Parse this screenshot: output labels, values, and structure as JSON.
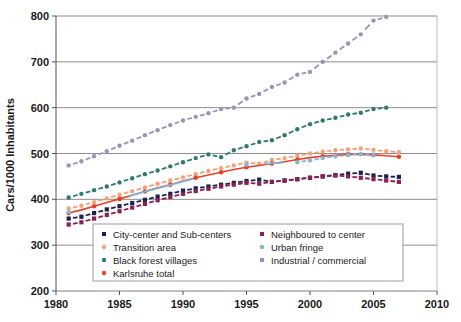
{
  "chart_data": {
    "type": "scatter",
    "title": "",
    "xlabel": "",
    "ylabel": "Cars/1000 Inhabitants",
    "xlim": [
      1980,
      2010
    ],
    "ylim": [
      200,
      800
    ],
    "xticks": [
      1980,
      1985,
      1990,
      1995,
      2000,
      2005,
      2010
    ],
    "yticks": [
      200,
      300,
      400,
      500,
      600,
      700,
      800
    ],
    "grid": "horizontal",
    "legend_position": "inside-bottom-center",
    "series": [
      {
        "name": "City-center and Sub-centers",
        "color": "#1f2050",
        "marker": "square-dashed",
        "x": [
          1981,
          1982,
          1983,
          1984,
          1985,
          1986,
          1987,
          1988,
          1989,
          1990,
          1991,
          1992,
          1993,
          1994,
          1995,
          1996,
          1997,
          1998,
          1999,
          2000,
          2001,
          2002,
          2003,
          2004,
          2005,
          2006,
          2007
        ],
        "y": [
          358,
          362,
          370,
          378,
          385,
          392,
          399,
          406,
          412,
          419,
          424,
          428,
          432,
          436,
          440,
          443,
          438,
          441,
          444,
          447,
          450,
          453,
          456,
          458,
          452,
          450,
          449
        ]
      },
      {
        "name": "Transition area",
        "color": "#f5a177",
        "marker": "circle-dashed",
        "x": [
          1981,
          1982,
          1983,
          1984,
          1985,
          1986,
          1987,
          1988,
          1989,
          1990,
          1991,
          1992,
          1993,
          1994,
          1995,
          1996,
          1997,
          1998,
          1999,
          2000,
          2001,
          2002,
          2003,
          2004,
          2005,
          2006,
          2007
        ],
        "y": [
          380,
          386,
          394,
          402,
          410,
          418,
          426,
          434,
          441,
          448,
          455,
          462,
          468,
          474,
          480,
          478,
          486,
          490,
          495,
          500,
          504,
          507,
          509,
          511,
          508,
          505,
          503
        ]
      },
      {
        "name": "Black forest villages",
        "color": "#2e7a72",
        "marker": "circle-dashed",
        "x": [
          1981,
          1982,
          1983,
          1984,
          1985,
          1986,
          1987,
          1988,
          1989,
          1990,
          1991,
          1992,
          1993,
          1994,
          1995,
          1996,
          1997,
          1998,
          1999,
          2000,
          2001,
          2002,
          2003,
          2004,
          2005,
          2006
        ],
        "y": [
          404,
          412,
          420,
          428,
          437,
          446,
          455,
          463,
          472,
          481,
          490,
          498,
          492,
          507,
          516,
          525,
          529,
          540,
          553,
          564,
          572,
          578,
          585,
          589,
          597,
          600
        ]
      },
      {
        "name": "Karlsruhe total",
        "color": "#e8402a",
        "marker": "circle-line",
        "x": [
          1981,
          1982,
          1983,
          1984,
          1985,
          1986,
          1987,
          1988,
          1989,
          1990,
          1991,
          1992,
          1993,
          1994,
          1995,
          1996,
          1997,
          1998,
          1999,
          2000,
          2001,
          2002,
          2003,
          2004,
          2005,
          2006,
          2007
        ],
        "y": [
          370,
          377,
          385,
          393,
          401,
          409,
          417,
          425,
          432,
          440,
          447,
          453,
          459,
          465,
          470,
          474,
          478,
          482,
          487,
          491,
          494,
          496,
          498,
          498,
          497,
          495,
          493
        ]
      },
      {
        "name": "Neighboured to center",
        "color": "#8c2050",
        "marker": "square-dashed",
        "x": [
          1981,
          1982,
          1983,
          1984,
          1985,
          1986,
          1987,
          1988,
          1989,
          1990,
          1991,
          1992,
          1993,
          1994,
          1995,
          1996,
          1997,
          1998,
          1999,
          2000,
          2001,
          2002,
          2003,
          2004,
          2005,
          2006,
          2007
        ],
        "y": [
          345,
          350,
          358,
          366,
          374,
          382,
          390,
          398,
          405,
          412,
          418,
          423,
          428,
          432,
          436,
          434,
          438,
          441,
          444,
          447,
          450,
          452,
          450,
          447,
          444,
          441,
          438
        ]
      },
      {
        "name": "Urban fringe",
        "color": "#7fb8d8",
        "marker": "circle-dashed",
        "x": [
          1981,
          1995,
          1999,
          2000,
          2001,
          2002,
          2003,
          2004,
          2005
        ],
        "y": [
          372,
          476,
          481,
          485,
          490,
          494,
          497,
          499,
          497
        ]
      },
      {
        "name": "Industrial / commercial",
        "color": "#9a93b8",
        "marker": "circle-dashed",
        "x": [
          1981,
          1982,
          1983,
          1984,
          1985,
          1986,
          1987,
          1988,
          1989,
          1990,
          1991,
          1992,
          1993,
          1994,
          1995,
          1996,
          1997,
          1998,
          1999,
          2000,
          2001,
          2002,
          2003,
          2004,
          2005,
          2006
        ],
        "y": [
          474,
          483,
          494,
          505,
          517,
          528,
          540,
          551,
          562,
          572,
          580,
          588,
          597,
          600,
          620,
          630,
          645,
          655,
          672,
          678,
          700,
          720,
          740,
          760,
          790,
          798
        ]
      }
    ]
  },
  "axis": {
    "ylabel": "Cars/1000 Inhabitants",
    "ytick_labels": [
      "800",
      "700",
      "600",
      "500",
      "400",
      "300",
      "200"
    ],
    "xtick_labels": [
      "1980",
      "1985",
      "1990",
      "1995",
      "2000",
      "2005",
      "2010"
    ]
  },
  "legend": {
    "items": [
      {
        "label": "City-center and Sub-centers",
        "color": "#1f2050",
        "shape": "square"
      },
      {
        "label": "Transition area",
        "color": "#f5a177",
        "shape": "circle"
      },
      {
        "label": "Black forest villages",
        "color": "#2e7a72",
        "shape": "circle"
      },
      {
        "label": "Karlsruhe total",
        "color": "#e8402a",
        "shape": "circle"
      },
      {
        "label": "Neighboured to center",
        "color": "#8c2050",
        "shape": "square"
      },
      {
        "label": "Urban fringe",
        "color": "#7fb8d8",
        "shape": "circle"
      },
      {
        "label": "Industrial / commercial",
        "color": "#9a93b8",
        "shape": "square"
      }
    ]
  },
  "colors": {
    "grid": "#808080",
    "axis": "#555555",
    "background": "#ffffff",
    "legend_border": "#9a9a9a"
  }
}
